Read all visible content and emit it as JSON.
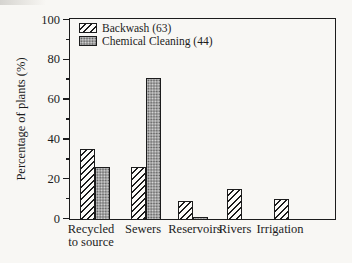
{
  "colors": {
    "background": "#f8f7f4",
    "ink": "#1c1c1c",
    "stipple_gray": "#a4a4a4",
    "hatch_fill": "#fcfbf8"
  },
  "chart_data": {
    "type": "bar",
    "title": "",
    "xlabel": "",
    "ylabel": "Percentage of plants (%)",
    "ylim": [
      0,
      100
    ],
    "yticks": [
      0,
      20,
      40,
      60,
      80,
      100
    ],
    "minor_yticks": [
      10,
      30,
      50,
      70,
      90
    ],
    "grid": false,
    "legend_position": "top-left-inside",
    "categories": [
      "Recycled to source",
      "Sewers",
      "Reservoirs",
      "Rivers",
      "Irrigation"
    ],
    "x_tick_display": [
      "Recycled\nto source",
      "Sewers",
      "Reservoirs",
      "Rivers",
      "Irrigation"
    ],
    "series": [
      {
        "name": "Backwash (63)",
        "pattern": "diagonal-hatch",
        "values": [
          35,
          26,
          9,
          15,
          10
        ]
      },
      {
        "name": "Chemical Cleaning (44)",
        "pattern": "gray-stipple",
        "values": [
          26,
          71,
          1,
          null,
          null
        ]
      }
    ]
  }
}
